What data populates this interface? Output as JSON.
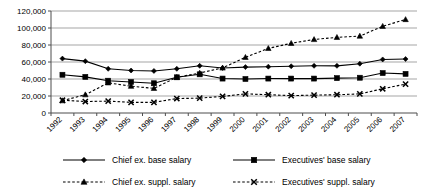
{
  "chart_data": {
    "type": "line",
    "title": "",
    "subtitle": "",
    "xlabel": "",
    "ylabel": "",
    "grid": "horizontal",
    "legend_position": "bottom",
    "ylim": [
      0,
      120000
    ],
    "ytick_labels": [
      "0",
      "20,000",
      "40,000",
      "60,000",
      "80,000",
      "100,000",
      "120,000"
    ],
    "ytick_values": [
      0,
      20000,
      40000,
      60000,
      80000,
      100000,
      120000
    ],
    "categories": [
      "1992",
      "1993",
      "1994",
      "1995",
      "1996",
      "1997",
      "1998",
      "1999",
      "2000",
      "2001",
      "2002",
      "2003",
      "2004",
      "2005",
      "2006",
      "2007"
    ],
    "series": [
      {
        "name": "Chief ex. base salary",
        "marker": "diamond",
        "line": "solid",
        "values": [
          64000,
          61000,
          52000,
          50000,
          49500,
          52000,
          55500,
          53000,
          54000,
          54500,
          55000,
          55500,
          55500,
          58000,
          63000,
          63500
        ]
      },
      {
        "name": "Executives' base salary",
        "marker": "square",
        "line": "solid",
        "values": [
          45000,
          42500,
          38000,
          36500,
          35000,
          42000,
          45500,
          40500,
          40000,
          40500,
          40500,
          40500,
          41000,
          41500,
          47000,
          46000
        ]
      },
      {
        "name": "Chief ex. suppl. salary",
        "marker": "triangle",
        "line": "dashed",
        "values": [
          14500,
          21500,
          35500,
          31500,
          29000,
          42000,
          47000,
          53000,
          65500,
          76000,
          82000,
          86500,
          89000,
          90500,
          102000,
          110000
        ]
      },
      {
        "name": "Executives' suppl. salary",
        "marker": "x",
        "line": "dashed",
        "values": [
          15000,
          13500,
          14000,
          12500,
          12500,
          17000,
          17500,
          19500,
          22500,
          21500,
          20500,
          21000,
          21500,
          22500,
          28500,
          34000
        ]
      }
    ]
  },
  "legend": {
    "items": [
      {
        "label": "Chief ex. base salary"
      },
      {
        "label": "Executives' base salary"
      },
      {
        "label": "Chief ex. suppl. salary"
      },
      {
        "label": "Executives' suppl. salary"
      }
    ]
  }
}
